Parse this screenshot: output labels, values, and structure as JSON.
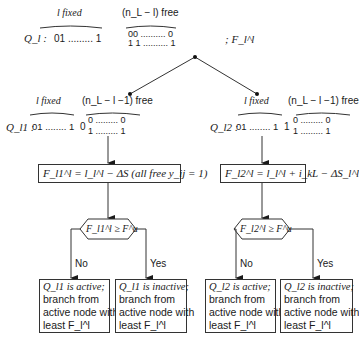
{
  "root": {
    "fixed_label": "l fixed",
    "free_label": "(n_L − l) free",
    "node_label": "Q_l :",
    "fixed_bits": "01 ......... 1",
    "free_bits_top": "00 .......... 0",
    "free_bits_bottom": "1 1 .......... 1",
    "bound_label": "; F_l^l"
  },
  "left_branch": {
    "fixed_label": "l fixed",
    "free_label": "(n_L − l −1) free",
    "node_label": "Q_l1 :",
    "fixed_bits": "01 ........ 1",
    "branch_bit": "0",
    "free_bits_top": "0 ......... 0",
    "free_bits_bottom": "1 ......... 1",
    "equation": "F_l1^l = l_l^l − ΔS (all free y_ij = 1)",
    "decision": "F_l1^l ≥ F^u",
    "no_label": "No",
    "yes_label": "Yes",
    "no_outcome": [
      "Q_l1 is active;",
      "branch from",
      "active node with",
      "least F_l^l"
    ],
    "yes_outcome": [
      "Q_l1 is inactive;",
      "branch from",
      "active node with",
      "least F_l^l"
    ]
  },
  "right_branch": {
    "fixed_label": "l fixed",
    "free_label": "(n_L − l −1) free",
    "node_label": "Q_l2 :",
    "fixed_bits": "01 ........ 1",
    "branch_bit": "1",
    "free_bits_top": "0 ......... 0",
    "free_bits_bottom": "1 ......... 1",
    "equation": "F_l2^l = l_l^l + i_kL − ΔS_l^l",
    "decision": "F_l2^l ≥ F^u",
    "no_label": "No",
    "yes_label": "Yes",
    "no_outcome": [
      "Q_l2 is active;",
      "branch from",
      "active node with",
      "least F_l^l"
    ],
    "yes_outcome": [
      "Q_l2 is inactive;",
      "branch from",
      "active node with",
      "least F_l^l"
    ]
  },
  "colors": {
    "ink": "#1a1a1a",
    "background": "#ffffff"
  }
}
